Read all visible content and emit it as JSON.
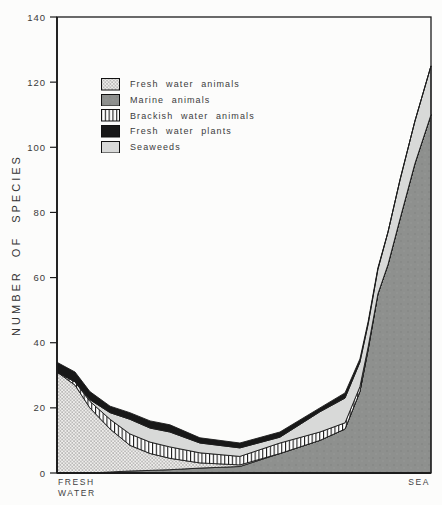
{
  "figure": {
    "ylabel": "NUMBER OF SPECIES",
    "x_left_label": "FRESH\nWATER",
    "x_right_label": "SEA"
  },
  "legend": {
    "items": [
      {
        "label": "Fresh water animals",
        "pattern": "stipple"
      },
      {
        "label": "Marine animals",
        "pattern": "marine"
      },
      {
        "label": "Brackish water animals",
        "pattern": "vlines"
      },
      {
        "label": "Fresh water plants",
        "pattern": "solid-black"
      },
      {
        "label": "Seaweeds",
        "pattern": "light-gray"
      }
    ]
  },
  "colors": {
    "background": "#fcfcfb",
    "line": "#1c1c1c",
    "marine": "#8e908e",
    "marine_speck_dark": "#808280",
    "marine_speck_light": "#9a9c9a",
    "seaweeds": "#d8d9d8",
    "plants": "#181818",
    "stipple_bg": "#efeeec",
    "stipple_dot": "#6f6f6f",
    "vline_bg": "#ffffff",
    "vline_ink": "#1e1e1e",
    "text": "#3a3a3a"
  },
  "chart_data": {
    "type": "area",
    "stacked": true,
    "title": "",
    "ylabel": "NUMBER OF SPECIES",
    "xlabel_left": "FRESH WATER",
    "xlabel_right": "SEA",
    "x_axis_note": "salinity gradient from fresh water (0) to sea (100), percent of axis length",
    "ylim": [
      0,
      140
    ],
    "yticks": [
      0,
      20,
      40,
      60,
      80,
      100,
      120,
      140
    ],
    "grid": false,
    "legend_position": "upper-left-inside",
    "x_percent": [
      0,
      4.8,
      8.8,
      14.2,
      19.5,
      24.9,
      30.2,
      38.2,
      48.9,
      59.6,
      70.3,
      77.0,
      81.0,
      83.2,
      85.8,
      88.5,
      91.7,
      95.7,
      100
    ],
    "stack_order_bottom_to_top": [
      "Marine animals",
      "Fresh water animals",
      "Brackish water animals",
      "Seaweeds",
      "Fresh water plants"
    ],
    "series": [
      {
        "name": "Marine animals",
        "pattern": "marine",
        "values": [
          0,
          0,
          0,
          0.3,
          0.6,
          0.8,
          1,
          1.5,
          2,
          6,
          10,
          13.5,
          25,
          38,
          55,
          64,
          78,
          95,
          110
        ]
      },
      {
        "name": "Fresh water animals",
        "pattern": "stipple",
        "values": [
          31,
          27,
          20,
          13.2,
          7.9,
          5.2,
          3.5,
          1.6,
          0.5,
          0,
          0,
          0,
          0,
          0,
          0,
          0,
          0,
          0,
          0
        ]
      },
      {
        "name": "Brackish water animals",
        "pattern": "vlines",
        "values": [
          0,
          1,
          2,
          3,
          3.5,
          3.5,
          3.5,
          3.1,
          2.6,
          3.2,
          2.6,
          1.9,
          1.5,
          0.8,
          0,
          0,
          0,
          0,
          0
        ]
      },
      {
        "name": "Seaweeds",
        "pattern": "light-gray",
        "values": [
          0,
          0,
          0.5,
          2,
          4.5,
          4.3,
          4.6,
          3,
          2.6,
          1.8,
          6.2,
          7.6,
          7.5,
          7,
          7.5,
          10,
          12,
          13,
          15
        ]
      },
      {
        "name": "Fresh water plants",
        "pattern": "solid-black",
        "values": [
          3,
          3,
          2.5,
          2,
          2,
          2.2,
          2.2,
          1.6,
          1.5,
          1.6,
          1.2,
          1.6,
          1,
          0.8,
          0.5,
          0,
          0,
          0,
          0
        ]
      }
    ]
  }
}
